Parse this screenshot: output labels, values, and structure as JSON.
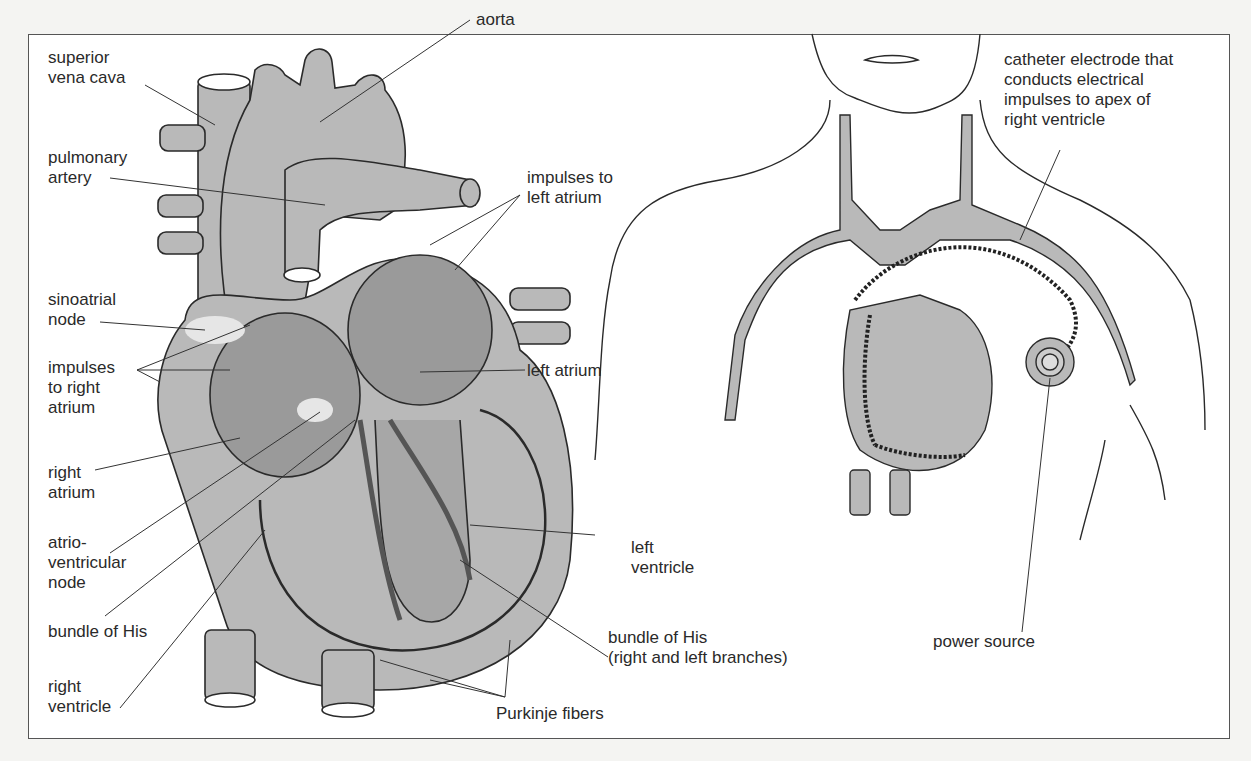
{
  "figure": {
    "left_panel": {
      "title": "Conduction system of the heart",
      "labels": {
        "superior_vena_cava": "superior\nvena cava",
        "aorta": "aorta",
        "pulmonary_artery": "pulmonary\nartery",
        "impulses_left_atrium": "impulses to\nleft atrium",
        "sinoatrial_node": "sinoatrial\nnode",
        "impulses_right_atrium": "impulses\nto right\natrium",
        "left_atrium": "left atrium",
        "right_atrium": "right\natrium",
        "av_node": "atrio-\nventricular\nnode",
        "left_ventricle": "left\nventricle",
        "bundle_of_his": "bundle of His",
        "bundle_branches": "bundle of His\n(right and left branches)",
        "right_ventricle": "right\nventricle",
        "purkinje": "Purkinje fibers"
      }
    },
    "right_panel": {
      "title": "Artificial pacemaker",
      "labels": {
        "catheter": "catheter electrode that\nconducts electrical\nimpulses to apex of\nright ventricle",
        "power_source": "power source"
      }
    },
    "colors": {
      "tissue": "#b9b9b9",
      "outline": "#2a2a2a",
      "background": "#ffffff",
      "node_highlight": "#e6e6e6"
    }
  }
}
